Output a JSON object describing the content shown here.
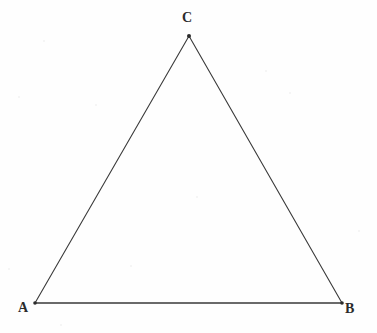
{
  "figure": {
    "width": 377,
    "height": 333,
    "background_color": "#fefefe",
    "stroke_color": "#3a3a3a",
    "label_color": "#2b2b2b",
    "stroke_width": 1.1
  },
  "chart_data": {
    "type": "diagram",
    "shape": "triangle",
    "grid": false,
    "legend": null,
    "xlabel": "",
    "ylabel": "",
    "xlim": [
      0,
      377
    ],
    "ylim": [
      333,
      0
    ],
    "points": [
      {
        "name": "A",
        "label": "A",
        "x": 35,
        "y": 303,
        "label_x": 25,
        "label_y": 310,
        "label_position": "below-left"
      },
      {
        "name": "B",
        "label": "B",
        "x": 342,
        "y": 303,
        "label_x": 351,
        "label_y": 311,
        "label_position": "below-right"
      },
      {
        "name": "C",
        "label": "C",
        "x": 189,
        "y": 36,
        "label_x": 189,
        "label_y": 19,
        "label_position": "above"
      }
    ],
    "edges": [
      {
        "name": "AB",
        "from": "A",
        "to": "B",
        "label": ""
      },
      {
        "name": "BC",
        "from": "B",
        "to": "C",
        "label": ""
      },
      {
        "name": "CA",
        "from": "C",
        "to": "A",
        "label": ""
      }
    ]
  },
  "labels": {
    "a": "A",
    "b": "B",
    "c": "C"
  }
}
